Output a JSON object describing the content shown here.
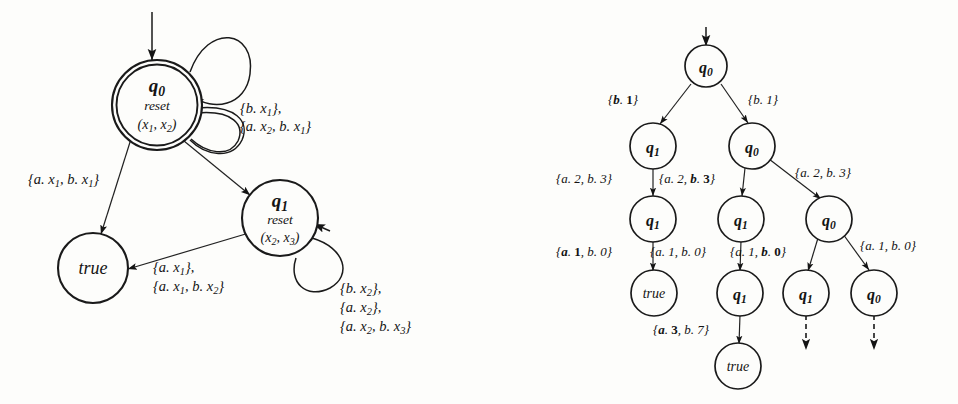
{
  "figure": {
    "kind": "two-automaton-diagrams",
    "background_color": "#fdfdfb",
    "ink_color": "#141414"
  },
  "left_diagram": {
    "name": "symbolic-automaton",
    "start_arrow": "incoming-start-arrow",
    "nodes": [
      {
        "id": "q0",
        "label": "q",
        "sublabel": "0",
        "line2": "reset",
        "line3": "(x",
        "line3_sub_a": "1",
        "line3_mid": ", x",
        "line3_sub_b": "2",
        "line3_end": ")",
        "accepting": true
      },
      {
        "id": "q1",
        "label": "q",
        "sublabel": "1",
        "line2": "reset",
        "line3": "(x",
        "line3_sub_a": "2",
        "line3_mid": ", x",
        "line3_sub_b": "3",
        "line3_end": ")",
        "accepting": false
      },
      {
        "id": "true",
        "label": "true",
        "accepting": false
      }
    ],
    "edges": [
      {
        "from": "q0",
        "to": "true",
        "label_lines": [
          "{a. x1, b. x1}"
        ]
      },
      {
        "from": "q0",
        "to": "q1",
        "label_lines": []
      },
      {
        "from": "q0",
        "to": "q0",
        "kind": "self-loop",
        "label_lines": [
          "{b. x1},",
          "{a. x2, b. x1}"
        ]
      },
      {
        "from": "q1",
        "to": "true",
        "label_lines": [
          "{a. x1},",
          "{a. x1, b. x2}"
        ]
      },
      {
        "from": "q1",
        "to": "q1",
        "kind": "self-loop",
        "label_lines": [
          "{b. x2},",
          "{a. x2},",
          "{a. x2, b. x3}"
        ]
      }
    ]
  },
  "right_diagram": {
    "name": "unrolled-run-tree",
    "start_arrow": "incoming-start-arrow",
    "levels": [
      {
        "level": 0,
        "nodes": [
          {
            "id": "r0",
            "label": "q",
            "sub": "0"
          }
        ]
      },
      {
        "level": 1,
        "nodes": [
          {
            "id": "n10",
            "label": "q",
            "sub": "1"
          },
          {
            "id": "n11",
            "label": "q",
            "sub": "0"
          }
        ]
      },
      {
        "level": 2,
        "nodes": [
          {
            "id": "n20",
            "label": "q",
            "sub": "1"
          },
          {
            "id": "n21",
            "label": "q",
            "sub": "1"
          },
          {
            "id": "n22",
            "label": "q",
            "sub": "0"
          }
        ]
      },
      {
        "level": 3,
        "nodes": [
          {
            "id": "n30",
            "label": "true",
            "sub": ""
          },
          {
            "id": "n31",
            "label": "q",
            "sub": "1"
          },
          {
            "id": "n32",
            "label": "q",
            "sub": "1"
          },
          {
            "id": "n33",
            "label": "q",
            "sub": "0"
          }
        ]
      },
      {
        "level": 4,
        "nodes": [
          {
            "id": "n40",
            "label": "true",
            "sub": ""
          }
        ]
      }
    ],
    "edge_labels": {
      "root_left": "{b. 1}",
      "root_right": "{b. 1}",
      "l1_left": "{a. 2, b. 3}",
      "l1_mid": "{a. 2, b. 3}",
      "l1_right": "{a. 2, b. 3}",
      "l2_a": "{a. 1, b. 0}",
      "l2_b": "{a. 1, b. 0}",
      "l2_c": "{a. 1, b. 0}",
      "l2_d": "{a. 1, b. 0}",
      "l3_a": "{a. 3, b. 7}"
    },
    "continuation_arrows": [
      "dashed-arrow-under-q1",
      "dashed-arrow-under-q0"
    ]
  }
}
